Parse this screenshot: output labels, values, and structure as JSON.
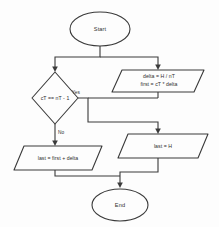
{
  "diagram": {
    "type": "flowchart",
    "title": "",
    "background_color": "#fdfdfd",
    "stroke_color": "#3a3a3a",
    "nodes": [
      {
        "id": "start",
        "shape": "terminator",
        "label": "Start"
      },
      {
        "id": "delta_calc",
        "shape": "parallelogram",
        "label_line1": "delta = H / nT",
        "label_line2": "first = cT * delta"
      },
      {
        "id": "decision",
        "shape": "diamond",
        "label": "cT == nT - 1"
      },
      {
        "id": "last_h",
        "shape": "parallelogram",
        "label": "last = H"
      },
      {
        "id": "last_first_delta",
        "shape": "parallelogram",
        "label": "last = first + delta"
      },
      {
        "id": "end",
        "shape": "terminator",
        "label": "End"
      }
    ],
    "branch_labels": {
      "yes": "Yes",
      "no": "No"
    }
  }
}
